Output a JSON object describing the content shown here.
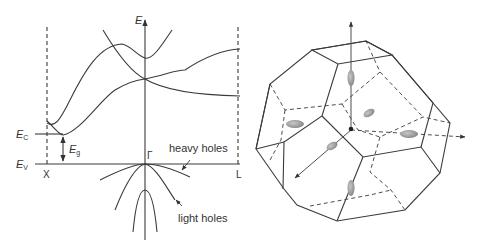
{
  "band_diagram": {
    "energy_axis_label": "E",
    "conduction_label": "E",
    "conduction_sub": "C",
    "valence_label": "E",
    "valence_sub": "V",
    "gap_label": "E",
    "gap_sub": "g",
    "point_x": "X",
    "point_gamma": "Γ",
    "point_l": "L",
    "heavy_holes": "heavy holes",
    "light_holes": "light holes"
  },
  "brillouin_zone": {
    "shape": "truncated-octahedron",
    "valleys": 6
  },
  "colors": {
    "line": "#3a3a3a",
    "ellipsoid": "#9a9a9a"
  }
}
